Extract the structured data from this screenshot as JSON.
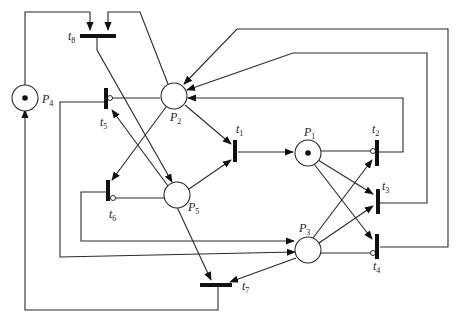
{
  "diagram": {
    "type": "petri-net",
    "places": [
      {
        "id": "P1",
        "label": "P",
        "sub": "1",
        "tokens": 1
      },
      {
        "id": "P2",
        "label": "P",
        "sub": "2",
        "tokens": 0
      },
      {
        "id": "P3",
        "label": "P",
        "sub": "3",
        "tokens": 0
      },
      {
        "id": "P4",
        "label": "P",
        "sub": "4",
        "tokens": 1
      },
      {
        "id": "P5",
        "label": "P",
        "sub": "5",
        "tokens": 0
      }
    ],
    "transitions": [
      {
        "id": "t1",
        "label": "t",
        "sub": "1"
      },
      {
        "id": "t2",
        "label": "t",
        "sub": "2"
      },
      {
        "id": "t3",
        "label": "t",
        "sub": "3"
      },
      {
        "id": "t4",
        "label": "t",
        "sub": "4"
      },
      {
        "id": "t5",
        "label": "t",
        "sub": "5"
      },
      {
        "id": "t6",
        "label": "t",
        "sub": "6"
      },
      {
        "id": "t7",
        "label": "t",
        "sub": "7"
      },
      {
        "id": "t8",
        "label": "t",
        "sub": "8"
      }
    ],
    "arcs": [
      {
        "from": "P4",
        "to": "t8"
      },
      {
        "from": "P2",
        "to": "t8"
      },
      {
        "from": "t8",
        "to": "P5"
      },
      {
        "from": "P2",
        "to": "t1"
      },
      {
        "from": "P5",
        "to": "t1"
      },
      {
        "from": "t1",
        "to": "P1"
      },
      {
        "from": "P2",
        "to": "t6"
      },
      {
        "from": "P5",
        "to": "t5"
      },
      {
        "from": "P2",
        "to": "t5",
        "inhibitor": true
      },
      {
        "from": "P5",
        "to": "t6",
        "inhibitor": true
      },
      {
        "from": "t5",
        "to": "P3"
      },
      {
        "from": "t6",
        "to": "P3"
      },
      {
        "from": "P5",
        "to": "t7"
      },
      {
        "from": "P3",
        "to": "t7"
      },
      {
        "from": "t7",
        "to": "P4"
      },
      {
        "from": "P1",
        "to": "t2",
        "inhibitor": true
      },
      {
        "from": "P1",
        "to": "t3"
      },
      {
        "from": "P1",
        "to": "t4"
      },
      {
        "from": "P3",
        "to": "t2"
      },
      {
        "from": "P3",
        "to": "t3"
      },
      {
        "from": "P3",
        "to": "t4",
        "inhibitor": true
      },
      {
        "from": "t2",
        "to": "P2"
      },
      {
        "from": "t3",
        "to": "P2"
      },
      {
        "from": "t4",
        "to": "P2"
      }
    ]
  }
}
